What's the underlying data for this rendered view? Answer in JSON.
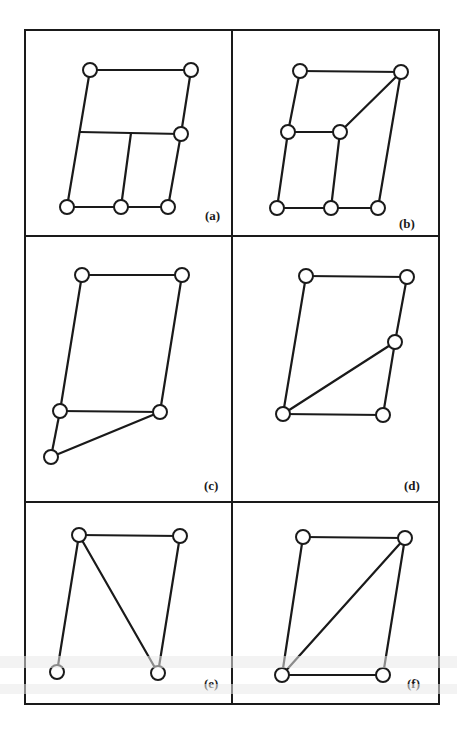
{
  "figure": {
    "panels": [
      {
        "label": "(a)",
        "frame": [
          25,
          30,
          232,
          236
        ],
        "label_pos": [
          205,
          220
        ],
        "nodes": [
          [
            90,
            70
          ],
          [
            191,
            70
          ],
          [
            181,
            134
          ],
          [
            67,
            207
          ],
          [
            121,
            207
          ],
          [
            168,
            207
          ]
        ],
        "edges": [
          [
            [
              90,
              70
            ],
            [
              191,
              70
            ]
          ],
          [
            [
              191,
              70
            ],
            [
              181,
              134
            ]
          ],
          [
            [
              181,
              134
            ],
            [
              168,
              207
            ]
          ],
          [
            [
              90,
              70
            ],
            [
              67,
              207
            ]
          ],
          [
            [
              80,
              132
            ],
            [
              181,
              134
            ]
          ],
          [
            [
              131,
              133
            ],
            [
              121,
              207
            ]
          ],
          [
            [
              67,
              207
            ],
            [
              121,
              207
            ]
          ],
          [
            [
              121,
              207
            ],
            [
              168,
              207
            ]
          ]
        ]
      },
      {
        "label": "(b)",
        "frame": [
          232,
          30,
          439,
          236
        ],
        "label_pos": [
          399,
          228
        ],
        "nodes": [
          [
            300,
            71
          ],
          [
            401,
            72
          ],
          [
            288,
            132
          ],
          [
            340,
            132
          ],
          [
            277,
            208
          ],
          [
            331,
            208
          ],
          [
            378,
            208
          ]
        ],
        "edges": [
          [
            [
              300,
              71
            ],
            [
              401,
              72
            ]
          ],
          [
            [
              401,
              72
            ],
            [
              340,
              132
            ]
          ],
          [
            [
              401,
              72
            ],
            [
              378,
              208
            ]
          ],
          [
            [
              300,
              71
            ],
            [
              288,
              132
            ]
          ],
          [
            [
              288,
              132
            ],
            [
              340,
              132
            ]
          ],
          [
            [
              288,
              132
            ],
            [
              277,
              208
            ]
          ],
          [
            [
              340,
              132
            ],
            [
              331,
              208
            ]
          ],
          [
            [
              277,
              208
            ],
            [
              331,
              208
            ]
          ],
          [
            [
              331,
              208
            ],
            [
              378,
              208
            ]
          ]
        ]
      },
      {
        "label": "(c)",
        "frame": [
          25,
          236,
          232,
          502
        ],
        "label_pos": [
          204,
          490
        ],
        "nodes": [
          [
            82,
            275
          ],
          [
            182,
            275
          ],
          [
            60,
            411
          ],
          [
            160,
            412
          ],
          [
            51,
            457
          ]
        ],
        "edges": [
          [
            [
              82,
              275
            ],
            [
              182,
              275
            ]
          ],
          [
            [
              82,
              275
            ],
            [
              60,
              411
            ]
          ],
          [
            [
              182,
              275
            ],
            [
              160,
              412
            ]
          ],
          [
            [
              60,
              411
            ],
            [
              160,
              412
            ]
          ],
          [
            [
              60,
              411
            ],
            [
              51,
              457
            ]
          ],
          [
            [
              51,
              457
            ],
            [
              160,
              412
            ]
          ]
        ]
      },
      {
        "label": "(d)",
        "frame": [
          232,
          236,
          439,
          502
        ],
        "label_pos": [
          404,
          490
        ],
        "nodes": [
          [
            306,
            276
          ],
          [
            407,
            277
          ],
          [
            395,
            342
          ],
          [
            283,
            414
          ],
          [
            383,
            415
          ]
        ],
        "edges": [
          [
            [
              306,
              276
            ],
            [
              407,
              277
            ]
          ],
          [
            [
              407,
              277
            ],
            [
              395,
              342
            ]
          ],
          [
            [
              395,
              342
            ],
            [
              383,
              415
            ]
          ],
          [
            [
              306,
              276
            ],
            [
              283,
              414
            ]
          ],
          [
            [
              283,
              414
            ],
            [
              395,
              342
            ]
          ],
          [
            [
              283,
              414
            ],
            [
              383,
              415
            ]
          ]
        ]
      },
      {
        "label": "(e)",
        "frame": [
          25,
          502,
          232,
          704
        ],
        "label_pos": [
          204,
          688
        ],
        "nodes": [
          [
            79,
            535
          ],
          [
            180,
            536
          ],
          [
            57,
            672
          ],
          [
            158,
            673
          ]
        ],
        "edges": [
          [
            [
              79,
              535
            ],
            [
              180,
              536
            ]
          ],
          [
            [
              79,
              535
            ],
            [
              57,
              672
            ]
          ],
          [
            [
              79,
              535
            ],
            [
              158,
              673
            ]
          ],
          [
            [
              180,
              536
            ],
            [
              158,
              673
            ]
          ]
        ]
      },
      {
        "label": "(f)",
        "frame": [
          232,
          502,
          439,
          704
        ],
        "label_pos": [
          407,
          688
        ],
        "nodes": [
          [
            303,
            537
          ],
          [
            405,
            538
          ],
          [
            282,
            675
          ],
          [
            383,
            675
          ]
        ],
        "edges": [
          [
            [
              303,
              537
            ],
            [
              405,
              538
            ]
          ],
          [
            [
              303,
              537
            ],
            [
              282,
              675
            ]
          ],
          [
            [
              405,
              538
            ],
            [
              282,
              675
            ]
          ],
          [
            [
              405,
              538
            ],
            [
              383,
              675
            ]
          ],
          [
            [
              282,
              675
            ],
            [
              383,
              675
            ]
          ]
        ]
      }
    ]
  }
}
